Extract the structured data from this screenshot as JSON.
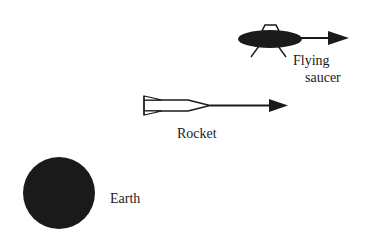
{
  "diagram": {
    "type": "reference-frames-illustration",
    "colors": {
      "ink": "#1a1a1a",
      "background": "#ffffff"
    },
    "objects": [
      {
        "id": "flying-saucer",
        "label_lines": [
          "Flying",
          "saucer"
        ],
        "has_velocity_arrow": true
      },
      {
        "id": "rocket",
        "label": "Rocket",
        "has_velocity_arrow": true
      },
      {
        "id": "earth",
        "label": "Earth",
        "has_velocity_arrow": false
      }
    ]
  },
  "labels": {
    "saucer_line1": "Flying",
    "saucer_line2": "saucer",
    "rocket": "Rocket",
    "earth": "Earth"
  }
}
